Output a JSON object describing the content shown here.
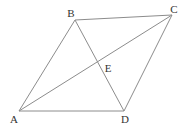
{
  "figure": {
    "background_color": "#ffffff",
    "line_color": "#8c8c8c",
    "label_color": "#333333",
    "width": 185,
    "height": 135,
    "points": {
      "A": {
        "x": 19,
        "y": 111
      },
      "B": {
        "x": 75,
        "y": 20
      },
      "C": {
        "x": 172,
        "y": 15
      },
      "D": {
        "x": 124,
        "y": 111
      },
      "E": {
        "x": 97.5,
        "y": 62
      }
    },
    "edges": [
      {
        "from": "A",
        "to": "B"
      },
      {
        "from": "B",
        "to": "C"
      },
      {
        "from": "C",
        "to": "D"
      },
      {
        "from": "D",
        "to": "A"
      },
      {
        "from": "A",
        "to": "C"
      },
      {
        "from": "B",
        "to": "D"
      }
    ],
    "labels": [
      {
        "text": "A",
        "x": 14,
        "y": 123
      },
      {
        "text": "B",
        "x": 71,
        "y": 16.5
      },
      {
        "text": "C",
        "x": 174,
        "y": 13
      },
      {
        "text": "D",
        "x": 125,
        "y": 123
      },
      {
        "text": "E",
        "x": 108,
        "y": 71.5
      }
    ]
  }
}
